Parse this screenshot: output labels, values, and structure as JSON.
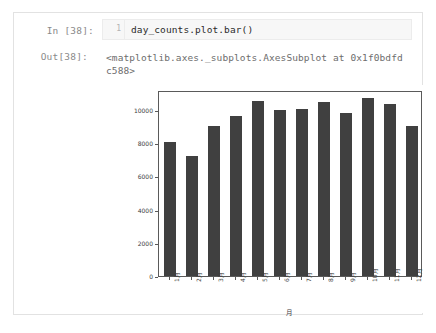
{
  "notebook": {
    "input_prompt": "In [38]:",
    "output_prompt": "Out[38]:",
    "line_number": "1",
    "code": "day_counts.plot.bar()",
    "output_text": "<matplotlib.axes._subplots.AxesSubplot at 0x1f0bdfdc588>"
  },
  "colors": {
    "bar": "#404040",
    "axis": "#5a5a5a",
    "cell_border": "#e2e2e2",
    "cell_marker": "#8e8e8e",
    "code_bg": "#f7f7f7",
    "prompt_text": "#8a8a8a",
    "output_text": "#6d6d6d"
  },
  "chart_data": {
    "type": "bar",
    "title": "",
    "xlabel": "月",
    "ylabel": "",
    "categories": [
      "1月",
      "2月",
      "3月",
      "4月",
      "5月",
      "6月",
      "7月",
      "8月",
      "9月",
      "10月",
      "11月",
      "12月"
    ],
    "values": [
      8050,
      7200,
      9050,
      9650,
      10550,
      10000,
      10050,
      10450,
      9800,
      10700,
      10350,
      9050
    ],
    "ylim": [
      0,
      11200
    ],
    "yticks": [
      0,
      2000,
      4000,
      6000,
      8000,
      10000
    ],
    "ytick_labels": [
      "0",
      "2000",
      "4000",
      "6000",
      "8000",
      "10000"
    ],
    "grid": false,
    "legend": false,
    "xtick_rotation": 90
  }
}
